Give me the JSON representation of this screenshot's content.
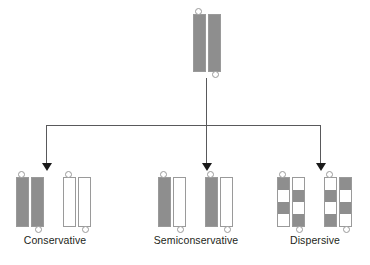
{
  "diagram": {
    "colors": {
      "old_strand": "#8e8e8e",
      "new_strand": "#ffffff",
      "outline": "#9a9a9a",
      "connector_line": "#59595b",
      "arrow": "#1a1a1a",
      "label_text": "#231f20",
      "background": "#ffffff"
    },
    "parent": {
      "name": "parent-dna-duplex",
      "strands": [
        {
          "id": "parent-strand-left",
          "fill": "gray"
        },
        {
          "id": "parent-strand-right",
          "fill": "gray"
        }
      ],
      "tabs": [
        "top-left",
        "bottom-right"
      ]
    },
    "branches": [
      {
        "id": "conservative",
        "label": "Conservative",
        "duplexes": [
          {
            "id": "conservative-duplex-1",
            "strands": [
              {
                "id": "strand-left",
                "fill": "gray"
              },
              {
                "id": "strand-right",
                "fill": "gray"
              }
            ]
          },
          {
            "id": "conservative-duplex-2",
            "strands": [
              {
                "id": "strand-left",
                "fill": "white"
              },
              {
                "id": "strand-right",
                "fill": "white"
              }
            ]
          }
        ]
      },
      {
        "id": "semiconservative",
        "label": "Semiconservative",
        "duplexes": [
          {
            "id": "semiconservative-duplex-1",
            "strands": [
              {
                "id": "strand-left",
                "fill": "gray"
              },
              {
                "id": "strand-right",
                "fill": "white"
              }
            ]
          },
          {
            "id": "semiconservative-duplex-2",
            "strands": [
              {
                "id": "strand-left",
                "fill": "gray"
              },
              {
                "id": "strand-right",
                "fill": "white"
              }
            ]
          }
        ]
      },
      {
        "id": "dispersive",
        "label": "Dispersive",
        "duplexes": [
          {
            "id": "dispersive-duplex-1",
            "strands": [
              {
                "id": "strand-left",
                "fill": "checker",
                "blocks": [
                  "g",
                  "w",
                  "g",
                  "w"
                ]
              },
              {
                "id": "strand-right",
                "fill": "checker",
                "blocks": [
                  "w",
                  "g",
                  "w",
                  "g"
                ]
              }
            ]
          },
          {
            "id": "dispersive-duplex-2",
            "strands": [
              {
                "id": "strand-left",
                "fill": "checker",
                "blocks": [
                  "w",
                  "g",
                  "w",
                  "g"
                ]
              },
              {
                "id": "strand-right",
                "fill": "checker",
                "blocks": [
                  "g",
                  "w",
                  "g",
                  "w"
                ]
              }
            ]
          }
        ]
      }
    ]
  }
}
